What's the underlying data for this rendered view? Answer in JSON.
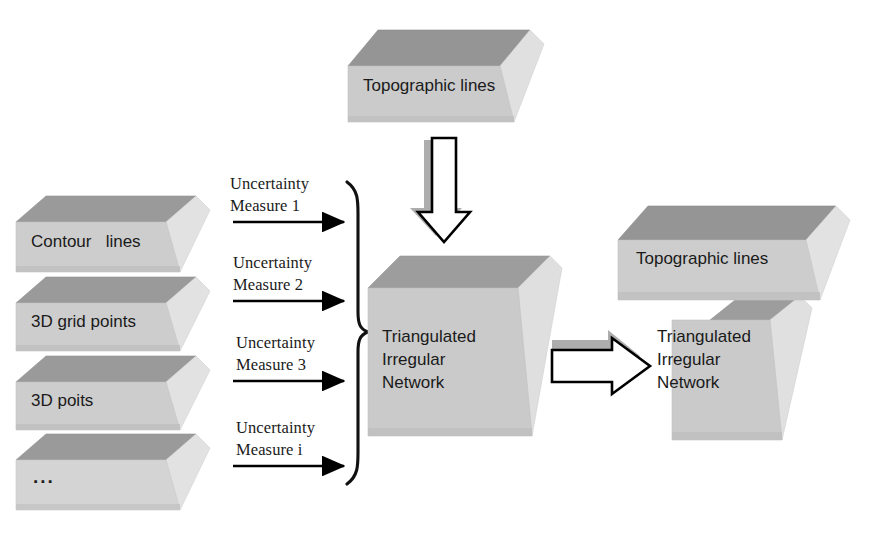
{
  "diagram": {
    "colors": {
      "face": "#c9c9c9",
      "face_light": "#d2d2d2",
      "top": "#9a9a9a",
      "side": "#dcdcdc",
      "outline": "#000000",
      "shadow": "#a8a8a8",
      "background": "#ffffff",
      "text": "#1a1a1a"
    },
    "top_source": {
      "label": "Topographic lines",
      "shape": "slab-3d"
    },
    "inputs": [
      {
        "label": "Contour   lines",
        "shape": "slab-3d"
      },
      {
        "label": "3D grid points",
        "shape": "slab-3d"
      },
      {
        "label": "3D poits",
        "shape": "slab-3d"
      },
      {
        "label": "...",
        "shape": "slab-3d"
      }
    ],
    "measures": [
      {
        "line1": "Uncertainty",
        "line2": "Measure 1"
      },
      {
        "line1": "Uncertainty",
        "line2": "Measure 2"
      },
      {
        "line1": "Uncertainty",
        "line2": "Measure 3"
      },
      {
        "line1": "Uncertainty",
        "line2": "Measure i"
      }
    ],
    "brace": {
      "name": "right-curly-brace"
    },
    "center_box": {
      "line1": "Triangulated",
      "line2": "Irregular",
      "line3": "Network",
      "shape": "cube-3d"
    },
    "result": {
      "cap_label": "Topographic lines",
      "line1": "Triangulated",
      "line2": "Irregular",
      "line3": "Network",
      "shape": "stacked-cube-3d"
    },
    "arrows": {
      "down_block": "hollow-down-arrow",
      "right_block": "hollow-right-arrow",
      "thin": "solid-right-arrow"
    }
  }
}
